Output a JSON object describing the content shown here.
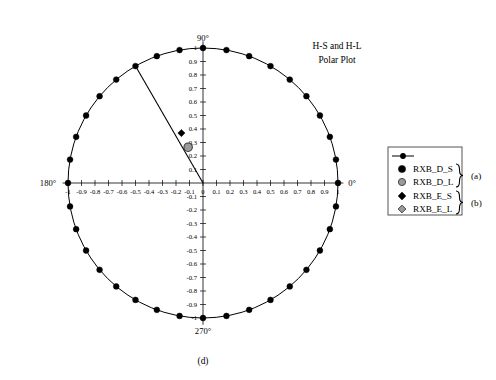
{
  "figure": {
    "title_line1": "H-S and H-L",
    "title_line2": "Polar Plot",
    "caption": "(d)"
  },
  "axes": {
    "angle_labels": {
      "right": "0°",
      "top": "90°",
      "left": "180°",
      "bottom": "270°"
    },
    "x_tick_labels": [
      "-1",
      "-0.9",
      "-0.8",
      "-0.7",
      "-0.6",
      "-0.5",
      "-0.4",
      "-0.3",
      "-0.2",
      "-0.1",
      "0",
      "0.1",
      "0.2",
      "0.3",
      "0.4",
      "0.5",
      "0.6",
      "0.7",
      "0.8",
      "0.9",
      "1"
    ],
    "x_tick_values": [
      -1,
      -0.9,
      -0.8,
      -0.7,
      -0.6,
      -0.5,
      -0.4,
      -0.3,
      -0.2,
      -0.1,
      0,
      0.1,
      0.2,
      0.3,
      0.4,
      0.5,
      0.6,
      0.7,
      0.8,
      0.9,
      1
    ],
    "y_tick_labels": [
      "1",
      "0.9",
      "0.8",
      "0.7",
      "0.6",
      "0.5",
      "0.4",
      "0.3",
      "0.2",
      "0.1",
      "0",
      "-0.1",
      "-0.2",
      "-0.3",
      "-0.4",
      "-0.5",
      "-0.6",
      "-0.7",
      "-0.8",
      "-0.9",
      "-1"
    ],
    "y_tick_values": [
      1,
      0.9,
      0.8,
      0.7,
      0.6,
      0.5,
      0.4,
      0.3,
      0.2,
      0.1,
      0,
      -0.1,
      -0.2,
      -0.3,
      -0.4,
      -0.5,
      -0.6,
      -0.7,
      -0.8,
      -0.9,
      -1
    ]
  },
  "legend": {
    "entries": [
      {
        "label": "",
        "marker": "line-with-dot",
        "color": "#000000"
      },
      {
        "label": "RXB_D_S",
        "marker": "filled-circle",
        "color": "#000000"
      },
      {
        "label": "RXB_D_L",
        "marker": "gray-circle",
        "color": "#8c8c8c"
      },
      {
        "label": "RXB_E_S",
        "marker": "filled-diamond",
        "color": "#000000"
      },
      {
        "label": "RXB_E_L",
        "marker": "gray-diamond",
        "color": "#8c8c8c"
      }
    ],
    "groups": [
      {
        "label": "(a)",
        "entries": [
          "RXB_D_S",
          "RXB_D_L"
        ]
      },
      {
        "label": "(b)",
        "entries": [
          "RXB_E_S",
          "RXB_E_L"
        ]
      }
    ]
  },
  "chart_data": {
    "type": "scatter",
    "xlabel": "",
    "ylabel": "",
    "xlim": [
      -1,
      1
    ],
    "ylim": [
      -1,
      1
    ],
    "grid": false,
    "legend_position": "right",
    "coordinate_system": "polar",
    "angle_unit": "degrees",
    "series": [
      {
        "name": "unit-circle-trace",
        "marker": "filled-circle",
        "color": "#000000",
        "radius": 1,
        "angle_step_deg": 10,
        "angles_deg": [
          0,
          10,
          20,
          30,
          40,
          50,
          60,
          70,
          80,
          90,
          100,
          110,
          120,
          130,
          140,
          150,
          160,
          170,
          180,
          190,
          200,
          210,
          220,
          230,
          240,
          250,
          260,
          270,
          280,
          290,
          300,
          310,
          320,
          330,
          340,
          350
        ],
        "values": [
          1,
          1,
          1,
          1,
          1,
          1,
          1,
          1,
          1,
          1,
          1,
          1,
          1,
          1,
          1,
          1,
          1,
          1,
          1,
          1,
          1,
          1,
          1,
          1,
          1,
          1,
          1,
          1,
          1,
          1,
          1,
          1,
          1,
          1,
          1,
          1
        ]
      },
      {
        "name": "RXB_E_S",
        "marker": "filled-diamond",
        "color": "#000000",
        "points": [
          {
            "x": -0.16,
            "y": 0.37,
            "r": 0.403,
            "theta_deg": 113.4
          }
        ]
      },
      {
        "name": "RXB_D_L",
        "marker": "gray-circle",
        "color": "#8c8c8c",
        "points": [
          {
            "x": -0.11,
            "y": 0.265,
            "r": 0.287,
            "theta_deg": 112.5
          }
        ]
      },
      {
        "name": "radial-line",
        "marker": "line",
        "color": "#000000",
        "points": [
          {
            "x": 0,
            "y": 0
          },
          {
            "x": -0.5,
            "y": 0.866,
            "r": 1,
            "theta_deg": 120
          }
        ]
      }
    ]
  }
}
